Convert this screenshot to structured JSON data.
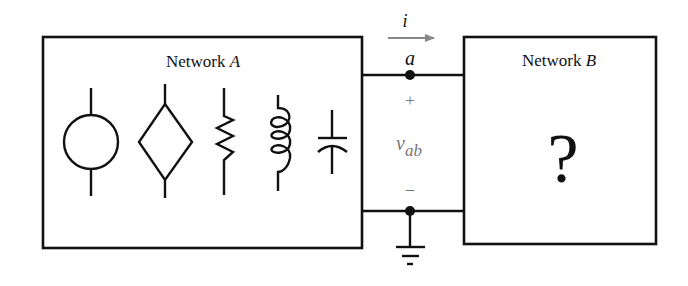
{
  "network_a": {
    "label_prefix": "Network ",
    "label_var": "A",
    "components": [
      {
        "type": "independent-source",
        "symbol": "circle"
      },
      {
        "type": "dependent-source",
        "symbol": "diamond"
      },
      {
        "type": "resistor",
        "symbol": "zigzag"
      },
      {
        "type": "inductor",
        "symbol": "coil"
      },
      {
        "type": "capacitor",
        "symbol": "plates"
      }
    ]
  },
  "network_b": {
    "label_prefix": "Network ",
    "label_var": "B",
    "content": "?"
  },
  "terminals": {
    "current_label": "i",
    "node_top_label": "a",
    "plus_sign": "+",
    "minus_sign": "–",
    "voltage_main": "v",
    "voltage_sub": "ab"
  },
  "colors": {
    "line": "#111111",
    "arrow": "#888888",
    "voltage_text": "#777777"
  }
}
